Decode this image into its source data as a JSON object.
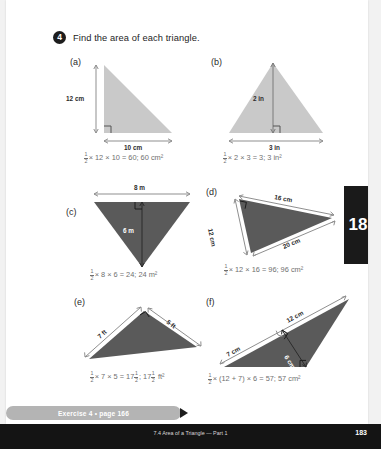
{
  "question": {
    "number": "4",
    "prompt": "Find the area of each triangle."
  },
  "colors": {
    "light_fill": "#c9c9c9",
    "dark_fill": "#5a5a5a",
    "page_bg": "#ffffff",
    "banner": "#b4b4b4",
    "tab": "#1a1a1a"
  },
  "problems": [
    {
      "label": "(a)",
      "fill": "light",
      "dims": {
        "height": "12 cm",
        "base": "10 cm"
      },
      "answer": {
        "half": "1/2",
        "expr": "× 12 × 10 = 60;  60 cm²"
      }
    },
    {
      "label": "(b)",
      "fill": "light",
      "dims": {
        "height": "2 in",
        "base": "3 in"
      },
      "answer": {
        "half": "1/2",
        "expr": "× 2 × 3 = 3;  3 in²"
      }
    },
    {
      "label": "(c)",
      "fill": "dark",
      "dims": {
        "base": "8 m",
        "height": "6 m"
      },
      "answer": {
        "half": "1/2",
        "expr": "× 8 × 6 = 24;  24 m²"
      }
    },
    {
      "label": "(d)",
      "fill": "dark",
      "dims": {
        "side_left": "12 cm",
        "side_top": "16 cm",
        "side_bottom": "20 cm"
      },
      "answer": {
        "half": "1/2",
        "expr": "× 12 × 16 = 96;  96 cm²"
      }
    },
    {
      "label": "(e)",
      "fill": "dark",
      "dims": {
        "side_left": "7 ft",
        "side_right": "5 ft"
      },
      "answer_prefix": {
        "half": "1/2",
        "expr": "× 7 × 5 = 17"
      },
      "answer_mixed_1": {
        "num": "1",
        "den": "2"
      },
      "answer_mid": ";  17",
      "answer_mixed_2": {
        "num": "1",
        "den": "2"
      },
      "answer_suffix": " ft²"
    },
    {
      "label": "(f)",
      "fill": "dark",
      "dims": {
        "side_top": "12 cm",
        "side_left": "7 cm",
        "height": "6 cm"
      },
      "answer": {
        "half": "1/2",
        "expr": "× (12 + 7) × 6 = 57;  57 cm²"
      }
    }
  ],
  "banner": {
    "text": "Exercise 4 • page 166"
  },
  "side_tab": {
    "text": "18"
  },
  "footer": {
    "title": "7.4 Area of a Triangle — Part 1",
    "page": "183"
  }
}
